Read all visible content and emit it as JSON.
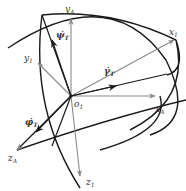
{
  "diagram": {
    "origin": {
      "label": "o",
      "subscript": "1"
    },
    "axes": {
      "y_A": {
        "label": "y",
        "subscript": "A"
      },
      "x_A": {
        "label": "x",
        "subscript": "A"
      },
      "z_A": {
        "label": "z",
        "subscript": "A"
      },
      "x_1": {
        "label": "x",
        "subscript": "1"
      },
      "y_1": {
        "label": "y",
        "subscript": "1"
      },
      "z_1": {
        "label": "z",
        "subscript": "1"
      }
    },
    "rates": {
      "psi": {
        "label": "ψ̇",
        "subscript": "T"
      },
      "gamma": {
        "label": "γ̇",
        "subscript": "T"
      },
      "phi": {
        "label": "φ̇",
        "subscript": "T"
      }
    },
    "colors": {
      "curve": "#1a1a1a",
      "reference_axis": "#8a8a8a",
      "rate_vector": "#1a1a1a",
      "text": "#333333",
      "background": "#ffffff"
    }
  }
}
